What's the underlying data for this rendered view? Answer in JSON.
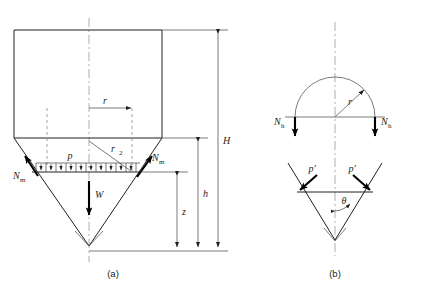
{
  "figure": {
    "panels": [
      {
        "id": "a",
        "caption": "(a)",
        "description": "Cylindrical silo with conical hopper, meridional forces, pressure distribution and vertical dimensions",
        "labels": {
          "radius": "r",
          "radius2_base": "r",
          "radius2_sub": "2",
          "pressure": "p",
          "weight": "W",
          "meridional_left_base": "N",
          "meridional_left_sub": "m",
          "meridional_right_base": "N",
          "meridional_right_sub": "m",
          "height_total": "H",
          "height_hopper": "h",
          "height_z": "z"
        }
      },
      {
        "id": "b",
        "caption": "(b)",
        "description": "Free body: hemispherical cap with hoop forces and hopper wall normal pressures with half angle theta",
        "labels": {
          "radius": "r",
          "hoop_left_base": "N",
          "hoop_left_sub": "h",
          "hoop_right_base": "N",
          "hoop_right_sub": "h",
          "pressure_left": "p'",
          "pressure_right": "p'",
          "angle": "θ"
        }
      }
    ]
  },
  "colors": {
    "outline": "#231f20",
    "thin": "#58595b",
    "dashed": "#8c8c8c",
    "centerline": "#9a9a9a",
    "arrow": "#000000",
    "background": "#ffffff"
  }
}
